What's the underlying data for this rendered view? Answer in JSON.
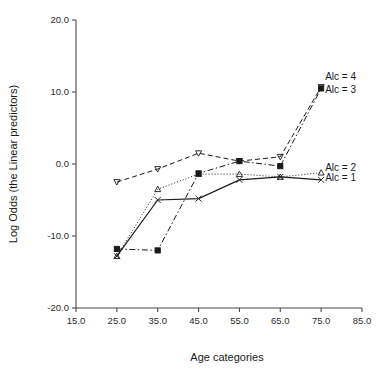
{
  "chart_data": {
    "type": "line",
    "title": "",
    "xlabel": "Age categories",
    "ylabel": "Log Odds (the Linear predictors)",
    "x": [
      25,
      35,
      45,
      55,
      65,
      75
    ],
    "xlim": [
      15,
      85
    ],
    "ylim": [
      -20,
      20
    ],
    "xticks": [
      "15.0",
      "25.0",
      "35.0",
      "45.0",
      "55.0",
      "65.0",
      "75.0",
      "85.0"
    ],
    "xtick_values": [
      15,
      25,
      35,
      45,
      55,
      65,
      75,
      85
    ],
    "yticks": [
      "20.0",
      "10.0",
      "0.0",
      "-10.0",
      "-20.0"
    ],
    "ytick_values": [
      20,
      10,
      0,
      -10,
      -20
    ],
    "grid": false,
    "legend_position": "inline-right",
    "series": [
      {
        "name": "Alc = 1",
        "label": "Alc = 1",
        "marker": "x",
        "linestyle": "solid",
        "color": "#1a1a1a",
        "values": [
          -12.8,
          -5.0,
          -4.8,
          -2.2,
          -1.8,
          -2.2
        ],
        "label_y": -2.4
      },
      {
        "name": "Alc = 2",
        "label": "Alc = 2",
        "marker": "triangle-up",
        "linestyle": "dotted",
        "color": "#1a1a1a",
        "values": [
          -12.8,
          -3.5,
          -1.4,
          -1.4,
          -1.8,
          -1.2
        ],
        "label_y": -1.0
      },
      {
        "name": "Alc = 3",
        "label": "Alc = 3",
        "marker": "square",
        "linestyle": "dashdot",
        "color": "#1a1a1a",
        "values": [
          -11.8,
          -12.0,
          -1.3,
          0.4,
          -0.3,
          10.5
        ],
        "label_y": 9.8
      },
      {
        "name": "Alc = 4",
        "label": "Alc = 4",
        "marker": "triangle-down",
        "linestyle": "dashed",
        "color": "#1a1a1a",
        "values": [
          -2.5,
          -0.7,
          1.5,
          0.4,
          1.0,
          10.7
        ],
        "label_y": 11.6
      }
    ]
  }
}
